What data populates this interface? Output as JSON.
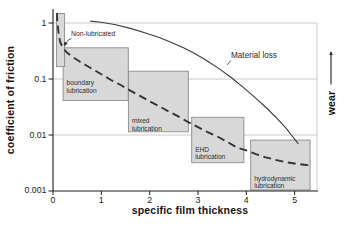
{
  "figure": {
    "background": "#ffffff",
    "axis_color": "#1c1c1c",
    "grid_color": "#c4c4c4",
    "box_fill": "#d8d8d8",
    "box_border": "#8a8a8a",
    "curve_color": "#333333"
  },
  "chart_data": {
    "type": "line",
    "title": "",
    "xlabel": "specific film thickness",
    "ylabel": "coefficient of friction",
    "x_ticks": [
      0,
      1,
      2,
      3,
      4,
      5
    ],
    "xlim": [
      0,
      5.46
    ],
    "y_scale": "log",
    "y_ticks": [
      1,
      0.1,
      0.01,
      0.001
    ],
    "y_tick_labels": [
      "1",
      "0.1",
      "0.01",
      "0.001"
    ],
    "ylim": [
      0.001,
      1.78
    ],
    "grid": "horizontal-decades",
    "legend_position": "none",
    "series": [
      {
        "name": "coefficient of friction (Stribeck curve)",
        "style": "dashed",
        "points": [
          [
            0.08,
            1.5
          ],
          [
            0.09,
            1.05
          ],
          [
            0.105,
            0.78
          ],
          [
            0.125,
            0.58
          ],
          [
            0.15,
            0.46
          ],
          [
            0.18,
            0.4
          ],
          [
            0.22,
            0.345
          ],
          [
            0.3,
            0.29
          ],
          [
            0.4,
            0.25
          ],
          [
            0.55,
            0.205
          ],
          [
            0.7,
            0.172
          ],
          [
            0.85,
            0.145
          ],
          [
            1.0,
            0.122
          ],
          [
            1.2,
            0.096
          ],
          [
            1.4,
            0.078
          ],
          [
            1.6,
            0.062
          ],
          [
            1.8,
            0.05
          ],
          [
            2.0,
            0.04
          ],
          [
            2.2,
            0.0325
          ],
          [
            2.4,
            0.0262
          ],
          [
            2.6,
            0.0212
          ],
          [
            2.8,
            0.017
          ],
          [
            3.0,
            0.0138
          ],
          [
            3.2,
            0.0112
          ],
          [
            3.4,
            0.0094
          ],
          [
            3.6,
            0.0076
          ],
          [
            3.8,
            0.006
          ],
          [
            4.0,
            0.0053
          ],
          [
            4.2,
            0.00455
          ],
          [
            4.4,
            0.004
          ],
          [
            4.6,
            0.0036
          ],
          [
            4.8,
            0.0033
          ],
          [
            5.0,
            0.0031
          ],
          [
            5.2,
            0.00295
          ],
          [
            5.35,
            0.00285
          ]
        ]
      },
      {
        "name": "Material loss",
        "style": "solid",
        "points": [
          [
            0.77,
            1.08
          ],
          [
            1.0,
            1.03
          ],
          [
            1.3,
            0.93
          ],
          [
            1.6,
            0.8
          ],
          [
            1.9,
            0.67
          ],
          [
            2.2,
            0.55
          ],
          [
            2.45,
            0.45
          ],
          [
            2.7,
            0.36
          ],
          [
            2.95,
            0.28
          ],
          [
            3.2,
            0.208
          ],
          [
            3.45,
            0.15
          ],
          [
            3.7,
            0.104
          ],
          [
            3.95,
            0.0695
          ],
          [
            4.2,
            0.0452
          ],
          [
            4.45,
            0.0285
          ],
          [
            4.65,
            0.0192
          ],
          [
            4.82,
            0.0133
          ],
          [
            4.95,
            0.0096
          ],
          [
            5.04,
            0.0076
          ],
          [
            5.08,
            0.0069
          ]
        ]
      }
    ],
    "regions": [
      {
        "name": "boundary lubrication",
        "label_lines": [
          "boundary",
          "lubrication"
        ],
        "x": [
          0.21,
          1.56
        ],
        "y": [
          0.041,
          0.36
        ]
      },
      {
        "name": "mixed lubrication",
        "label_lines": [
          "mixed",
          "lubrication"
        ],
        "x": [
          1.56,
          2.8
        ],
        "y": [
          0.0114,
          0.138
        ]
      },
      {
        "name": "EHD lubrication",
        "label_lines": [
          "EHD",
          "lubrication"
        ],
        "x": [
          2.87,
          3.95
        ],
        "y": [
          0.0032,
          0.0207
        ]
      },
      {
        "name": "hydrodynamic lubrication",
        "label_lines": [
          "hydrodynamic",
          "lubrication"
        ],
        "x": [
          4.09,
          5.32
        ],
        "y": [
          0.00104,
          0.0081
        ]
      },
      {
        "name": "non-lubricated zone",
        "label_lines": [],
        "x": [
          0.07,
          0.24
        ],
        "y": [
          0.167,
          1.48
        ]
      }
    ],
    "annotations": {
      "non_lubricated": "Non-lubricated",
      "material_loss": "Material loss",
      "wear": "wear"
    }
  }
}
